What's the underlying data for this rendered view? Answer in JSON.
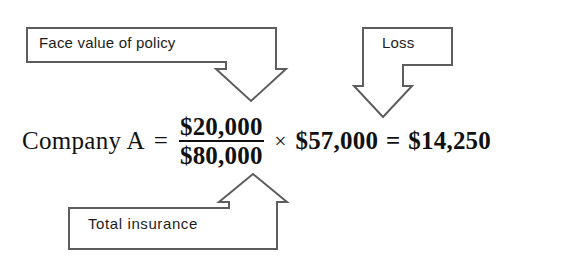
{
  "figure": {
    "type": "annotated-formula-diagram",
    "background_color": "#ffffff",
    "callout_stroke_color": "#5d5d5d",
    "text_color": "#1c1c1c"
  },
  "callouts": {
    "face_value": {
      "label": "Face value of policy",
      "points_to": "numerator",
      "arrow_direction": "down"
    },
    "loss": {
      "label": "Loss",
      "points_to": "multiplier",
      "arrow_direction": "down"
    },
    "total_insurance": {
      "label": "Total insurance",
      "points_to": "denominator",
      "arrow_direction": "up"
    }
  },
  "equation": {
    "subject": "Company A",
    "equals": "=",
    "fraction": {
      "numerator": "$20,000",
      "denominator": "$80,000"
    },
    "times": "×",
    "multiplier": "$57,000",
    "equals2": "=",
    "result": "$14,250"
  }
}
